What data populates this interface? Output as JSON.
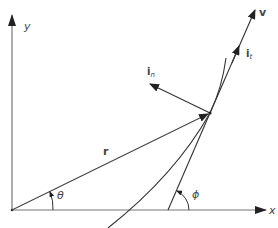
{
  "diagram": {
    "type": "kinematics-vector-diagram",
    "axes": {
      "x_label": "x",
      "y_label": "y"
    },
    "vectors": {
      "position": {
        "label": "r"
      },
      "velocity": {
        "label": "v"
      },
      "tangent_unit": {
        "label": "i",
        "subscript": "t"
      },
      "normal_unit": {
        "label": "i",
        "subscript": "n"
      }
    },
    "angles": {
      "theta": {
        "label": "θ"
      },
      "phi": {
        "label": "ϕ"
      }
    },
    "colors": {
      "line": "#333333",
      "axis": "#777777",
      "label": "#444444",
      "background": "#ffffff"
    }
  }
}
